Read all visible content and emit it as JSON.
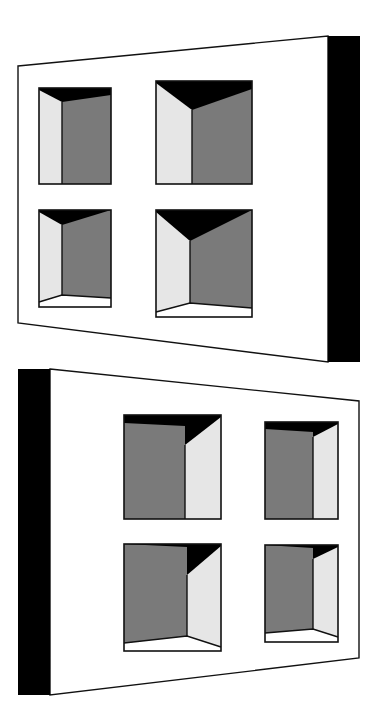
{
  "diagram": {
    "colors": {
      "background": "#ffffff",
      "wall_face": "#ffffff",
      "wall_side": "#000000",
      "window_back": "#7a7a7a",
      "window_side_lit": "#e6e6e6",
      "window_shadow": "#000000",
      "window_sill": "#ffffff",
      "outline": "#111111"
    },
    "panels": [
      {
        "id": "top-panel",
        "thick_edge": "right",
        "face": [
          [
            18,
            66
          ],
          [
            328,
            36
          ],
          [
            328,
            362
          ],
          [
            18,
            323
          ]
        ],
        "side": [
          [
            328,
            36
          ],
          [
            360,
            36
          ],
          [
            360,
            362
          ],
          [
            328,
            362
          ]
        ],
        "windows": [
          {
            "id": "tl",
            "frame": [
              39,
              88,
              111,
              184
            ],
            "lit_side": "left",
            "inner_x": 62,
            "shadow_y": 95,
            "shadow_corner_y": 102,
            "floor": null
          },
          {
            "id": "tr",
            "frame": [
              156,
              81,
              252,
              184
            ],
            "lit_side": "left",
            "inner_x": 192,
            "shadow_y": 89,
            "shadow_corner_y": 110,
            "floor": null
          },
          {
            "id": "bl",
            "frame": [
              39,
              210,
              111,
              307
            ],
            "lit_side": "left",
            "inner_x": 62,
            "shadow_y": 210,
            "shadow_corner_y": 225,
            "floor": [
              [
                39,
                302
              ],
              [
                62,
                295
              ],
              [
                111,
                298
              ]
            ]
          },
          {
            "id": "br",
            "frame": [
              156,
              210,
              252,
              317
            ],
            "lit_side": "left",
            "inner_x": 190,
            "shadow_y": 210,
            "shadow_corner_y": 241,
            "floor": [
              [
                156,
                312
              ],
              [
                190,
                303
              ],
              [
                252,
                308
              ]
            ]
          }
        ]
      },
      {
        "id": "bottom-panel",
        "thick_edge": "left",
        "face": [
          [
            50,
            369
          ],
          [
            359,
            401
          ],
          [
            359,
            658
          ],
          [
            50,
            695
          ]
        ],
        "side": [
          [
            18,
            369
          ],
          [
            50,
            369
          ],
          [
            50,
            695
          ],
          [
            18,
            695
          ]
        ],
        "windows": [
          {
            "id": "tl",
            "frame": [
              124,
              415,
              221,
              519
            ],
            "lit_side": "right",
            "inner_x": 185,
            "shadow_y": 423,
            "shadow_corner_y": 445,
            "floor": null
          },
          {
            "id": "tr",
            "frame": [
              265,
              422,
              338,
              519
            ],
            "lit_side": "right",
            "inner_x": 313,
            "shadow_y": 429,
            "shadow_corner_y": 437,
            "floor": null
          },
          {
            "id": "bl",
            "frame": [
              124,
              544,
              221,
              651
            ],
            "lit_side": "right",
            "inner_x": 187,
            "shadow_y": 544,
            "shadow_corner_y": 575,
            "floor": [
              [
                124,
                643
              ],
              [
                187,
                636
              ],
              [
                221,
                647
              ]
            ]
          },
          {
            "id": "br",
            "frame": [
              265,
              545,
              338,
              642
            ],
            "lit_side": "right",
            "inner_x": 313,
            "shadow_y": 545,
            "shadow_corner_y": 559,
            "floor": [
              [
                265,
                633
              ],
              [
                313,
                629
              ],
              [
                338,
                637
              ]
            ]
          }
        ]
      }
    ]
  }
}
